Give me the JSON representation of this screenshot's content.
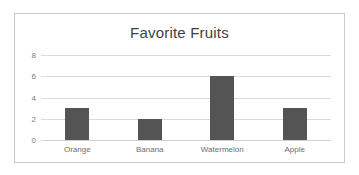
{
  "chart_data": {
    "type": "bar",
    "title": "Favorite Fruits",
    "categories": [
      "Orange",
      "Banana",
      "Watermelon",
      "Apple"
    ],
    "values": [
      3,
      2,
      6,
      3
    ],
    "xlabel": "",
    "ylabel": "",
    "ylim": [
      0,
      8
    ],
    "yticks": [
      0,
      2,
      4,
      6,
      8
    ],
    "grid": true,
    "legend": false,
    "bar_color": "#545454",
    "gridline_color": "#dadada",
    "title_color": "#3f3f3f",
    "tick_label_color": "#7b7b7b",
    "border_color": "#c9c9c9",
    "background_color": "#ffffff"
  }
}
